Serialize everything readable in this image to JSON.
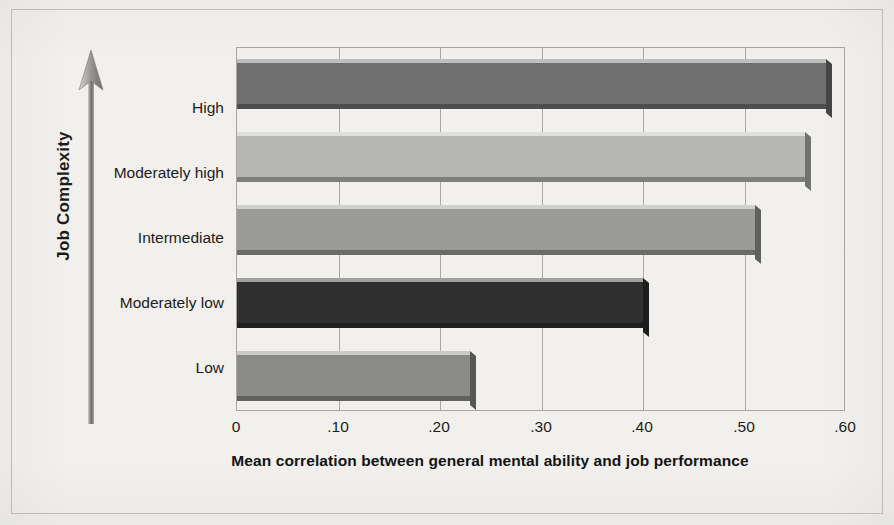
{
  "chart_data": {
    "type": "bar",
    "orientation": "horizontal",
    "title": "",
    "xlabel": "Mean correlation between general mental ability and job performance",
    "ylabel": "Job Complexity",
    "categories": [
      "High",
      "Moderately high",
      "Intermediate",
      "Moderately low",
      "Low"
    ],
    "values": [
      0.58,
      0.56,
      0.51,
      0.4,
      0.23
    ],
    "series": [
      {
        "name": "Mean correlation",
        "values": [
          0.58,
          0.56,
          0.51,
          0.4,
          0.23
        ]
      }
    ],
    "bars": [
      {
        "category": "High",
        "value": 0.58,
        "value_label": ".58",
        "color": "#6f6f6f"
      },
      {
        "category": "Moderately high",
        "value": 0.56,
        "value_label": ".56",
        "color": "#b6b6b4"
      },
      {
        "category": "Intermediate",
        "value": 0.51,
        "value_label": ".51",
        "color": "#9a9a98"
      },
      {
        "category": "Moderately low",
        "value": 0.4,
        "value_label": ".40",
        "color": "#2f2f2f"
      },
      {
        "category": "Low",
        "value": 0.23,
        "value_label": ".23",
        "color": "#8a8a88"
      }
    ],
    "xlim": [
      0,
      0.6
    ],
    "xticks": [
      0,
      0.1,
      0.2,
      0.3,
      0.4,
      0.5,
      0.6
    ],
    "xtick_labels": [
      "0",
      ".10",
      ".20",
      ".30",
      ".40",
      ".50",
      ".60"
    ],
    "grid": true,
    "grid_axis": "x",
    "legend": null,
    "legend_position": "none",
    "y_axis_arrow": "upward-arrow"
  },
  "figure": {
    "background_color": "#f1f0ed",
    "plot_border_color": "#a7a6a2",
    "gridline_color": "#a9a8a4",
    "text_color": "#1c1c1c"
  },
  "axis": {
    "y_title": "Job Complexity",
    "x_title": "Mean correlation between general mental ability and job performance"
  }
}
